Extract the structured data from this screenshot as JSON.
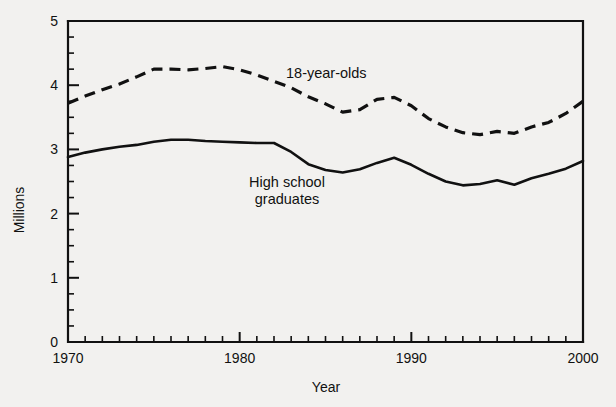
{
  "chart_data": {
    "type": "line",
    "title": "",
    "xlabel": "Year",
    "ylabel": "Millions",
    "xlim": [
      1970,
      2000
    ],
    "ylim": [
      0,
      5
    ],
    "grid": false,
    "legend_position": "inline-annotation",
    "x_ticks_major": [
      1970,
      1980,
      1990,
      2000
    ],
    "x_tick_labels": [
      "1970",
      "1980",
      "1990",
      "2000"
    ],
    "x_tick_interval_minor": 1,
    "y_ticks_major": [
      0,
      1,
      2,
      3,
      4,
      5
    ],
    "y_tick_labels": [
      "0",
      "1",
      "2",
      "3",
      "4",
      "5"
    ],
    "y_tick_interval_minor": 0.25,
    "x": [
      1970,
      1971,
      1972,
      1973,
      1974,
      1975,
      1976,
      1977,
      1978,
      1979,
      1980,
      1981,
      1982,
      1983,
      1984,
      1985,
      1986,
      1987,
      1988,
      1989,
      1990,
      1991,
      1992,
      1993,
      1994,
      1995,
      1996,
      1997,
      1998,
      1999,
      2000
    ],
    "series": [
      {
        "name": "18-year-olds",
        "style": "dashed",
        "label_text": "18-year-olds",
        "values": [
          3.72,
          3.83,
          3.93,
          4.02,
          4.13,
          4.25,
          4.25,
          4.24,
          4.26,
          4.29,
          4.24,
          4.16,
          4.06,
          3.96,
          3.82,
          3.71,
          3.58,
          3.62,
          3.78,
          3.81,
          3.68,
          3.48,
          3.35,
          3.26,
          3.23,
          3.28,
          3.25,
          3.35,
          3.42,
          3.56,
          3.75
        ]
      },
      {
        "name": "High school graduates",
        "style": "solid",
        "label_text_line1": "High school",
        "label_text_line2": "graduates",
        "values": [
          2.88,
          2.95,
          3.0,
          3.04,
          3.07,
          3.12,
          3.15,
          3.15,
          3.13,
          3.12,
          3.11,
          3.1,
          3.1,
          2.96,
          2.77,
          2.68,
          2.64,
          2.69,
          2.79,
          2.87,
          2.76,
          2.62,
          2.5,
          2.44,
          2.46,
          2.52,
          2.45,
          2.55,
          2.62,
          2.7,
          2.82
        ]
      }
    ]
  }
}
